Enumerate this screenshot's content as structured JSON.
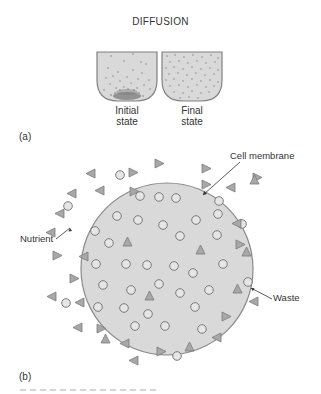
{
  "figure": {
    "title": "DIFFUSION",
    "panel_a": {
      "label": "(a)",
      "beakers": [
        {
          "name": "initial",
          "label_line1": "Initial",
          "label_line2": "state"
        },
        {
          "name": "final",
          "label_line1": "Final",
          "label_line2": "state"
        }
      ]
    },
    "panel_b": {
      "label": "(b)",
      "callouts": {
        "membrane": "Cell membrane",
        "nutrient": "Nutrient",
        "waste": "Waste"
      },
      "legend": {
        "triangle": "nutrient-molecule",
        "circle": "waste-molecule"
      }
    },
    "colors": {
      "fill_gray": "#d9d9d9",
      "stroke_gray": "#808080",
      "particle_dark": "#7a7a7a",
      "triangle_fill": "#a8a8a8",
      "circle_fill": "#e6e6e6"
    }
  }
}
